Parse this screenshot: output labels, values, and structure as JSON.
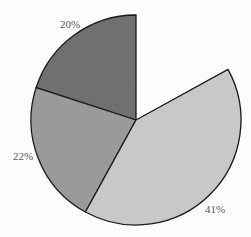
{
  "chart_data": {
    "type": "pie",
    "title": "",
    "slices": [
      {
        "label": "20%",
        "value": 20,
        "color": "#707070"
      },
      {
        "label": "22%",
        "value": 22,
        "color": "#9a9a9a"
      },
      {
        "label": "41%",
        "value": 41,
        "color": "#c8c8c8"
      }
    ],
    "missing_slice": {
      "value": 17,
      "rendered": false
    },
    "start_angle_deg": 0,
    "direction": "counterclockwise",
    "legend": "none",
    "edge_color": "#1a1a1a"
  },
  "geometry": {
    "cx": 136,
    "cy": 120,
    "r": 105
  },
  "labels": [
    {
      "text": "20%",
      "x": 60,
      "y": 28
    },
    {
      "text": "22%",
      "x": 13,
      "y": 160
    },
    {
      "text": "41%",
      "x": 205,
      "y": 213
    }
  ]
}
